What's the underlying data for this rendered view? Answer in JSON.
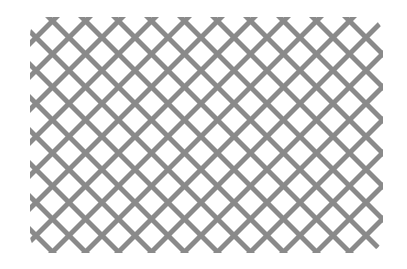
{
  "image": {
    "subject": "diagonal lattice panel",
    "lattice_color": "#8a8a8a",
    "background_color": "#ffffff",
    "cell_spacing_px": 33,
    "slat_width_px": 14
  }
}
